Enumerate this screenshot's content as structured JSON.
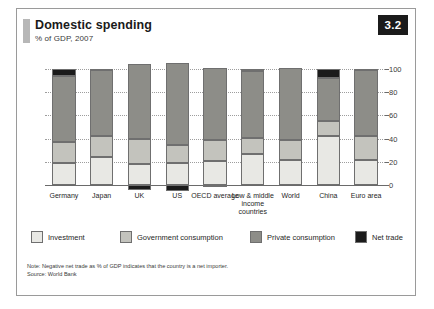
{
  "figure": {
    "title": "Domestic spending",
    "subtitle": "% of GDP, 2007",
    "badge": "3.2",
    "note": "Note: Negative net trade as % of GDP indicates that the country is a net importer.",
    "source": "Source: World Bank"
  },
  "colors": {
    "investment": "#e8e8e4",
    "government": "#c3c3bd",
    "private": "#8d8d88",
    "net_trade": "#1b1b1b",
    "badge_bg": "#1b1b1b",
    "badge_text": "#ffffff",
    "frame": "#9a9a9a",
    "axis": "#6a6a6a",
    "grid": "#9d9d9d"
  },
  "legend": [
    {
      "label": "Investment",
      "key": "investment"
    },
    {
      "label": "Government consumption",
      "key": "government"
    },
    {
      "label": "Private consumption",
      "key": "private"
    },
    {
      "label": "Net trade",
      "key": "net_trade"
    }
  ],
  "chart_data": {
    "type": "bar",
    "stacked": true,
    "title": "Domestic spending",
    "subtitle": "% of GDP, 2007",
    "xlabel": "",
    "ylabel": "",
    "ylim": [
      -10,
      105
    ],
    "yticks": [
      0,
      20,
      40,
      60,
      80,
      100
    ],
    "ytick_labels": [
      "0",
      "20",
      "40",
      "60",
      "80",
      "100"
    ],
    "grid": true,
    "legend_position": "bottom",
    "categories": [
      "Germany",
      "Japan",
      "UK",
      "US",
      "OECD average",
      "Low & middle income countries",
      "World",
      "China",
      "Euro area"
    ],
    "series": [
      {
        "name": "Investment",
        "values": [
          19,
          24,
          18,
          19,
          21,
          27,
          22,
          42,
          22
        ]
      },
      {
        "name": "Government consumption",
        "values": [
          18,
          18,
          22,
          16,
          18,
          14,
          17,
          13,
          20
        ]
      },
      {
        "name": "Private consumption",
        "values": [
          57,
          57,
          64,
          70,
          62,
          57,
          62,
          37,
          57
        ]
      },
      {
        "name": "Net trade",
        "values": [
          6,
          1,
          -4,
          -5,
          -1,
          2,
          0,
          8,
          1
        ]
      }
    ]
  }
}
